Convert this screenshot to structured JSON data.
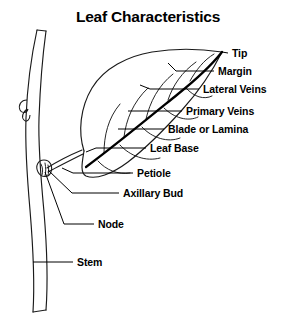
{
  "figure": {
    "title": "Leaf Characteristics",
    "title_x": 148,
    "title_y": 22,
    "background_color": "#ffffff",
    "ink_color": "#000000",
    "width": 293,
    "height": 335
  },
  "labels": [
    {
      "id": "tip",
      "text": "Tip",
      "x": 232,
      "y": 57,
      "anchor": "start"
    },
    {
      "id": "margin",
      "text": "Margin",
      "x": 218,
      "y": 75,
      "anchor": "start"
    },
    {
      "id": "lateral",
      "text": "Lateral Veins",
      "x": 203,
      "y": 93,
      "anchor": "start"
    },
    {
      "id": "primary",
      "text": "Primary Veins",
      "x": 186,
      "y": 115,
      "anchor": "start"
    },
    {
      "id": "blade",
      "text": "Blade or Lamina",
      "x": 168,
      "y": 133,
      "anchor": "start"
    },
    {
      "id": "base",
      "text": "Leaf Base",
      "x": 150,
      "y": 152,
      "anchor": "start"
    },
    {
      "id": "petiole",
      "text": "Petiole",
      "x": 137,
      "y": 177,
      "anchor": "start"
    },
    {
      "id": "axillary",
      "text": "Axillary Bud",
      "x": 123,
      "y": 197,
      "anchor": "start"
    },
    {
      "id": "node",
      "text": "Node",
      "x": 98,
      "y": 228,
      "anchor": "start"
    },
    {
      "id": "stem",
      "text": "Stem",
      "x": 77,
      "y": 266,
      "anchor": "start"
    }
  ],
  "leaders": [
    {
      "id": "leader-tip",
      "points": "228,53 222,52"
    },
    {
      "id": "leader-margin",
      "points": "214,71 176,71 168,63"
    },
    {
      "id": "leader-lateral",
      "points": "199,89 150,89 140,85"
    },
    {
      "id": "leader-primary",
      "points": "182,111 128,111"
    },
    {
      "id": "leader-blade",
      "points": "164,129 118,129"
    },
    {
      "id": "leader-base",
      "points": "146,148 96,148 86,152"
    },
    {
      "id": "leader-petiole",
      "points": "133,173 73,173 62,168"
    },
    {
      "id": "leader-axillary",
      "points": "119,193 72,193 48,170"
    },
    {
      "id": "leader-node",
      "points": "94,224 64,224 45,172"
    },
    {
      "id": "leader-stem",
      "points": "73,262 33,262"
    }
  ],
  "plant_parts": {
    "stem": {
      "name": "stem",
      "left_edge": "M 37,30 C 30,62 27,92 26,118 C 25,146 27,176 30,210 C 33,246 35,280 33,312",
      "right_edge": "M 46,31 C 42,60 40,90 39,118 C 38,148 41,180 44,212 C 47,248 48,282 46,310",
      "top_cap": "M 37,30 L 46,31",
      "bottom_cap": "M 33,312 L 46,310"
    },
    "stem_bud": {
      "name": "stem-lateral-bud-scar",
      "path": "M 27,100 C 21,100 18,105 20,110 C 22,114 27,113 28,109 M 27,109 C 23,112 21,117 24,120 C 27,123 30,119 30,115"
    },
    "axillary_bud": {
      "name": "axillary-bud",
      "outer": "M 44,160 C 38,160 35,166 38,172 C 41,178 49,178 51,172 C 53,166 50,160 44,160 Z",
      "detail": "M 41,164 C 43,168 43,172 42,175 M 45,163 C 46,168 46,172 45,176 M 48,165 C 49,169 49,173 48,175"
    },
    "petiole": {
      "name": "petiole",
      "upper": "M 47,168 C 58,161 70,155 82,150",
      "lower": "M 48,172 C 59,166 71,160 83,154"
    },
    "blade": {
      "name": "blade-outline",
      "upper_margin": "M 84,151 C 78,132 80,108 92,88 C 104,68 128,56 152,52 C 176,48 202,49 222,52",
      "lower_margin": "M 222,52 C 214,68 200,90 182,110 C 164,130 146,148 128,162 C 112,174 96,180 86,176 C 80,173 82,163 84,151"
    },
    "midrib": {
      "name": "primary-vein-midrib",
      "path": "M 86,167 C 112,148 146,120 178,94 C 198,78 214,62 222,52"
    },
    "lateral_veins": {
      "name": "lateral-veins",
      "upper_side": [
        "M 104,153 C 104,136 108,118 120,104",
        "M 124,137 C 126,120 133,102 148,88",
        "M 146,119 C 150,102 158,86 173,74",
        "M 168,100 C 173,85 182,72 196,62",
        "M 190,81 C 196,70 204,60 214,54"
      ],
      "lower_side": [
        "M 98,161 C 106,170 118,175 130,173",
        "M 120,145 C 130,156 146,162 160,158",
        "M 142,127 C 152,138 168,143 180,138",
        "M 164,108 C 174,118 188,122 198,117",
        "M 186,88 C 194,97 204,100 212,96"
      ]
    }
  }
}
